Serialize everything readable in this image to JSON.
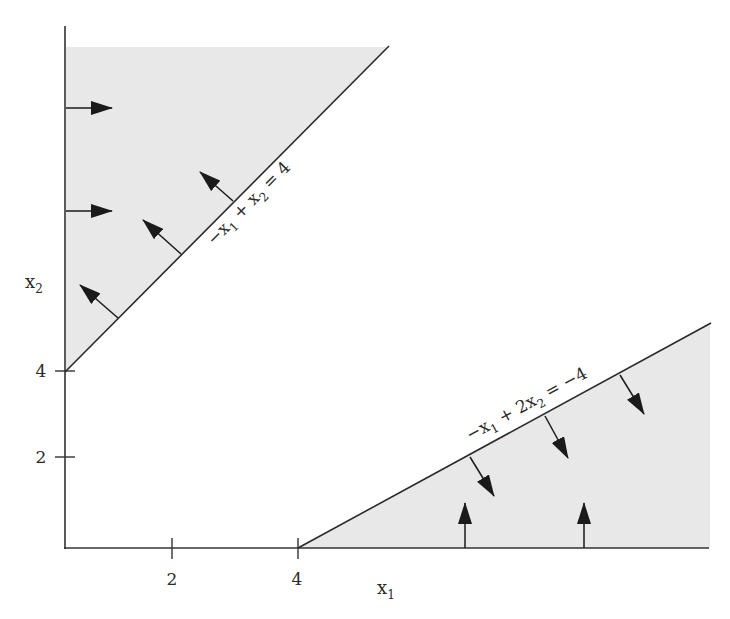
{
  "figure": {
    "type": "feasible-region-diagram",
    "axes": {
      "x_label": "x",
      "x_label_sub": "1",
      "y_label": "x",
      "y_label_sub": "2",
      "x_ticks": [
        "2",
        "4"
      ],
      "y_ticks": [
        "4",
        "2"
      ]
    },
    "constraints": [
      {
        "id": "upper-line",
        "parts": [
          "−x",
          "1",
          " + x",
          "2",
          " = 4"
        ],
        "text": "−x1 + x2 = 4",
        "direction": "up-left (≥ side shaded)"
      },
      {
        "id": "lower-line",
        "parts": [
          "−x",
          "1",
          " + 2x",
          "2",
          " = −4"
        ],
        "text": "−x1 + 2x2 = −4",
        "direction": "down-right (≤ side shaded)"
      }
    ],
    "regions": [
      {
        "id": "upper-left-region",
        "bounded_by": [
          "x1 ≥ 0",
          "−x1 + x2 ≥ 4"
        ]
      },
      {
        "id": "lower-right-region",
        "bounded_by": [
          "x2 ≥ 0",
          "−x1 + 2x2 ≤ −4"
        ]
      }
    ],
    "colors": {
      "shade": "#e8e8e8",
      "line": "#2a2a2a",
      "background": "#ffffff"
    }
  }
}
